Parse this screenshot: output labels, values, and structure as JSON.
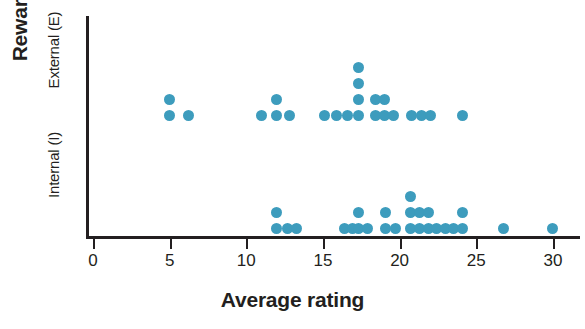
{
  "chart_data": {
    "type": "scatter",
    "title": "",
    "xlabel": "Average rating",
    "ylabel": "Reward",
    "xlim": [
      0,
      32
    ],
    "xticks": [
      0,
      5,
      10,
      15,
      20,
      25,
      30
    ],
    "xtick_labels": [
      "0",
      "5",
      "10",
      "15",
      "20",
      "25",
      "30"
    ],
    "ytick_labels": [
      "Internal (I)",
      "External (E)"
    ],
    "grid": false,
    "legend": "none",
    "dot_color": "#3d9cbd",
    "axis_color": "#231f20",
    "background": "#ffffff",
    "note": "Dot plot: each dot is one observation; dots stack vertically at repeated x values.",
    "series": [
      {
        "name": "External (E)",
        "baseline": "upper",
        "points": [
          {
            "x": 5.0,
            "stack": 0
          },
          {
            "x": 5.0,
            "stack": 1
          },
          {
            "x": 6.2,
            "stack": 0
          },
          {
            "x": 11.0,
            "stack": 0
          },
          {
            "x": 12.0,
            "stack": 0
          },
          {
            "x": 12.0,
            "stack": 1
          },
          {
            "x": 12.8,
            "stack": 0
          },
          {
            "x": 15.1,
            "stack": 0
          },
          {
            "x": 15.9,
            "stack": 0
          },
          {
            "x": 16.6,
            "stack": 0
          },
          {
            "x": 17.3,
            "stack": 0
          },
          {
            "x": 17.3,
            "stack": 1
          },
          {
            "x": 17.3,
            "stack": 2
          },
          {
            "x": 17.3,
            "stack": 3
          },
          {
            "x": 18.4,
            "stack": 0
          },
          {
            "x": 18.4,
            "stack": 1
          },
          {
            "x": 19.0,
            "stack": 0
          },
          {
            "x": 19.0,
            "stack": 1
          },
          {
            "x": 19.6,
            "stack": 0
          },
          {
            "x": 20.8,
            "stack": 0
          },
          {
            "x": 21.4,
            "stack": 0
          },
          {
            "x": 22.0,
            "stack": 0
          },
          {
            "x": 24.1,
            "stack": 0
          }
        ]
      },
      {
        "name": "Internal (I)",
        "baseline": "lower",
        "points": [
          {
            "x": 12.0,
            "stack": 0
          },
          {
            "x": 12.0,
            "stack": 1
          },
          {
            "x": 12.7,
            "stack": 0
          },
          {
            "x": 13.3,
            "stack": 0
          },
          {
            "x": 16.4,
            "stack": 0
          },
          {
            "x": 16.9,
            "stack": 0
          },
          {
            "x": 17.3,
            "stack": 0
          },
          {
            "x": 17.3,
            "stack": 1
          },
          {
            "x": 17.9,
            "stack": 0
          },
          {
            "x": 19.1,
            "stack": 0
          },
          {
            "x": 19.1,
            "stack": 1
          },
          {
            "x": 19.7,
            "stack": 0
          },
          {
            "x": 20.7,
            "stack": 0
          },
          {
            "x": 20.7,
            "stack": 1
          },
          {
            "x": 20.7,
            "stack": 2
          },
          {
            "x": 21.3,
            "stack": 0
          },
          {
            "x": 21.3,
            "stack": 1
          },
          {
            "x": 21.9,
            "stack": 0
          },
          {
            "x": 21.9,
            "stack": 1
          },
          {
            "x": 22.4,
            "stack": 0
          },
          {
            "x": 23.0,
            "stack": 0
          },
          {
            "x": 23.5,
            "stack": 0
          },
          {
            "x": 24.1,
            "stack": 0
          },
          {
            "x": 24.1,
            "stack": 1
          },
          {
            "x": 26.8,
            "stack": 0
          },
          {
            "x": 30.0,
            "stack": 0
          }
        ]
      }
    ]
  },
  "axes": {
    "y_title": "Reward",
    "y_categories": [
      {
        "key": "external",
        "label": "External (E)"
      },
      {
        "key": "internal",
        "label": "Internal (I)"
      }
    ],
    "x_title": "Average rating"
  },
  "geometry": {
    "x_pixel_at_zero": 93,
    "x_pixels_per_unit": 15.33,
    "external_baseline_y": 115,
    "internal_baseline_y": 228,
    "stack_step": 16
  }
}
